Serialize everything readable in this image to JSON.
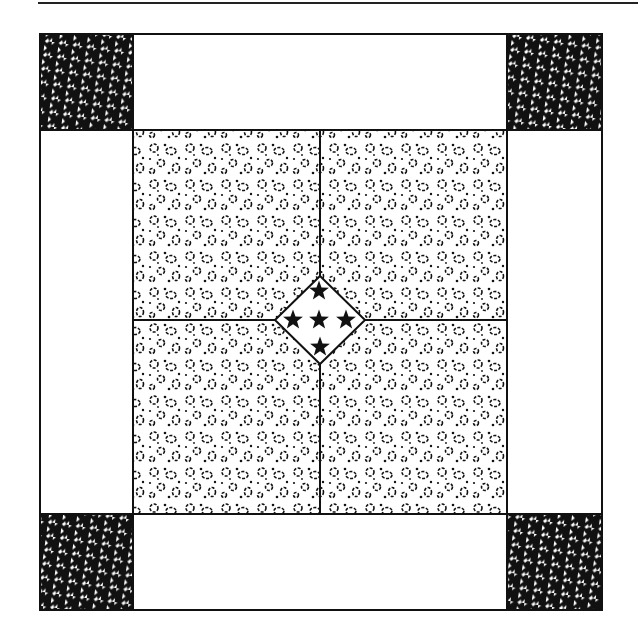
{
  "figure": {
    "colors": {
      "line": "#111111",
      "background": "#ffffff",
      "houndstooth_dark": "#111111",
      "houndstooth_light": "#ffffff"
    },
    "layout": {
      "outer_border": {
        "x": 39,
        "y": 33,
        "w": 564,
        "h": 578
      },
      "corner_squares": [
        {
          "position": "top-left",
          "pattern": "houndstooth"
        },
        {
          "position": "top-right",
          "pattern": "houndstooth"
        },
        {
          "position": "bottom-left",
          "pattern": "houndstooth"
        },
        {
          "position": "bottom-right",
          "pattern": "houndstooth"
        }
      ],
      "side_strips": [
        {
          "position": "top",
          "fill": "plain white"
        },
        {
          "position": "bottom",
          "fill": "plain white"
        },
        {
          "position": "left",
          "fill": "plain white"
        },
        {
          "position": "right",
          "fill": "plain white"
        }
      ],
      "center_quadrants": [
        {
          "position": "top-left",
          "pattern": "leopard spots"
        },
        {
          "position": "top-right",
          "pattern": "leopard spots"
        },
        {
          "position": "bottom-left",
          "pattern": "leopard spots"
        },
        {
          "position": "bottom-right",
          "pattern": "leopard spots"
        }
      ],
      "center_diamond": {
        "fill": "plain white",
        "star_count": 5,
        "star_arrangement": "top, left, center, right, bottom"
      }
    }
  }
}
